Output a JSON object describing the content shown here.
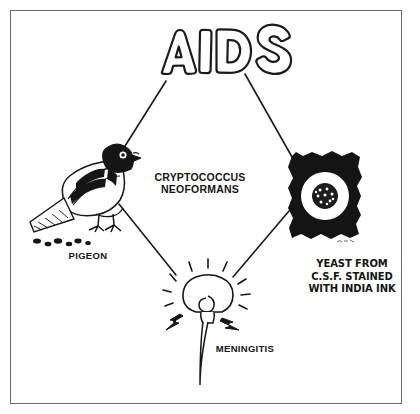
{
  "diagram": {
    "center_label": "CRYPTOCOCCUS\nNEOFORMANS",
    "nodes": [
      {
        "id": "pigeon",
        "label": "PIGEON",
        "icon": "pigeon-illustration"
      },
      {
        "id": "meningitis",
        "label": "MENINGITIS",
        "icon": "brain-spinal-cord-illustration"
      },
      {
        "id": "yeast",
        "label": "YEAST FROM\nC.S.F. STAINED\nWITH INDIA INK",
        "icon": "india-ink-slide-illustration"
      },
      {
        "id": "aids",
        "label": "AIDS",
        "icon": "bubble-letter-title"
      }
    ],
    "connectors": [
      {
        "from": "aids",
        "to": "pigeon"
      },
      {
        "from": "aids",
        "to": "yeast"
      },
      {
        "from": "pigeon",
        "to": "meningitis"
      },
      {
        "from": "yeast",
        "to": "meningitis"
      }
    ],
    "colors": {
      "ink": "#151515",
      "frame": "#6b6b6b",
      "background": "#ffffff"
    }
  }
}
